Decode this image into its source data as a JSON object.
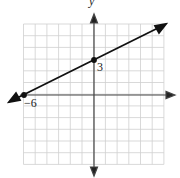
{
  "chart_data": {
    "type": "line",
    "title": "",
    "xlabel": "",
    "ylabel": "y",
    "xlim": [
      -6,
      6
    ],
    "ylim": [
      -6,
      6
    ],
    "grid": true,
    "series": [
      {
        "name": "line",
        "x": [
          -6,
          0,
          6
        ],
        "y": [
          0,
          3,
          6
        ]
      }
    ],
    "annotations": [
      {
        "text": "3",
        "x": 0,
        "y": 3,
        "note": "y-intercept"
      },
      {
        "text": "−6",
        "x": -6,
        "y": 0,
        "note": "x-intercept"
      }
    ],
    "points": [
      {
        "x": 0,
        "y": 3
      },
      {
        "x": -6,
        "y": 0
      }
    ]
  },
  "labels": {
    "y_axis": "y",
    "y_intercept": "3",
    "x_intercept": "−6"
  }
}
